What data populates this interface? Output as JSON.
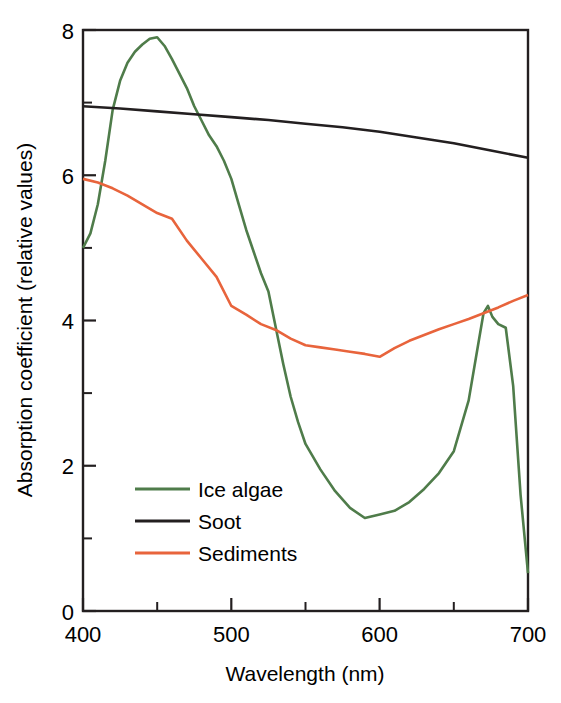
{
  "chart_data": {
    "type": "line",
    "title": "",
    "xlabel": "Wavelength (nm)",
    "ylabel": "Absorption coefficient (relative values)",
    "xlim": [
      400,
      700
    ],
    "ylim": [
      0,
      8
    ],
    "xticks": [
      400,
      500,
      600,
      700
    ],
    "xtick_labels": [
      "400",
      "500",
      "600",
      "700"
    ],
    "xticks_minor": [
      450,
      550,
      650
    ],
    "yticks": [
      0,
      2,
      4,
      6,
      8
    ],
    "ytick_labels": [
      "0",
      "2",
      "4",
      "6",
      "8"
    ],
    "yticks_minor": [
      1,
      3,
      5,
      7
    ],
    "grid": false,
    "legend_position": "center-left",
    "series": [
      {
        "name": "Ice algae",
        "color": "#4f7c4a",
        "x": [
          400,
          405,
          410,
          415,
          420,
          425,
          430,
          435,
          440,
          445,
          450,
          455,
          460,
          465,
          470,
          475,
          480,
          485,
          490,
          495,
          500,
          505,
          510,
          515,
          520,
          525,
          530,
          535,
          540,
          545,
          550,
          560,
          570,
          580,
          590,
          600,
          610,
          620,
          630,
          640,
          650,
          660,
          665,
          670,
          673,
          676,
          680,
          685,
          690,
          695,
          700
        ],
        "values": [
          5.0,
          5.2,
          5.6,
          6.2,
          6.9,
          7.3,
          7.55,
          7.7,
          7.8,
          7.88,
          7.9,
          7.78,
          7.6,
          7.4,
          7.2,
          6.95,
          6.75,
          6.55,
          6.4,
          6.2,
          5.95,
          5.6,
          5.25,
          4.95,
          4.65,
          4.4,
          3.9,
          3.4,
          2.95,
          2.6,
          2.3,
          1.95,
          1.65,
          1.42,
          1.28,
          1.33,
          1.38,
          1.5,
          1.68,
          1.9,
          2.2,
          2.9,
          3.5,
          4.1,
          4.2,
          4.05,
          3.95,
          3.9,
          3.1,
          1.6,
          0.52
        ]
      },
      {
        "name": "Soot",
        "color": "#231f20",
        "x": [
          400,
          425,
          450,
          475,
          500,
          525,
          550,
          575,
          600,
          625,
          650,
          675,
          700
        ],
        "values": [
          6.95,
          6.92,
          6.88,
          6.84,
          6.8,
          6.76,
          6.71,
          6.66,
          6.6,
          6.52,
          6.44,
          6.34,
          6.24
        ]
      },
      {
        "name": "Sediments",
        "color": "#e8643c",
        "x": [
          400,
          410,
          420,
          430,
          440,
          450,
          460,
          470,
          480,
          490,
          500,
          510,
          520,
          530,
          540,
          550,
          560,
          570,
          580,
          590,
          600,
          610,
          620,
          630,
          640,
          650,
          660,
          670,
          680,
          690,
          700
        ],
        "values": [
          5.95,
          5.9,
          5.82,
          5.72,
          5.6,
          5.48,
          5.4,
          5.1,
          4.85,
          4.6,
          4.2,
          4.08,
          3.95,
          3.87,
          3.75,
          3.66,
          3.63,
          3.6,
          3.57,
          3.54,
          3.5,
          3.62,
          3.72,
          3.8,
          3.88,
          3.95,
          4.02,
          4.1,
          4.18,
          4.27,
          4.35
        ]
      }
    ]
  },
  "legend": {
    "entries": [
      {
        "label": "Ice algae",
        "color": "#4f7c4a"
      },
      {
        "label": "Soot",
        "color": "#231f20"
      },
      {
        "label": "Sediments",
        "color": "#e8643c"
      }
    ]
  },
  "axes": {
    "x_title": "Wavelength (nm)",
    "y_title": "Absorption coefficient (relative values)",
    "x_tick_0": "400",
    "x_tick_1": "500",
    "x_tick_2": "600",
    "x_tick_3": "700",
    "y_tick_0": "0",
    "y_tick_1": "2",
    "y_tick_2": "4",
    "y_tick_3": "6",
    "y_tick_4": "8"
  }
}
